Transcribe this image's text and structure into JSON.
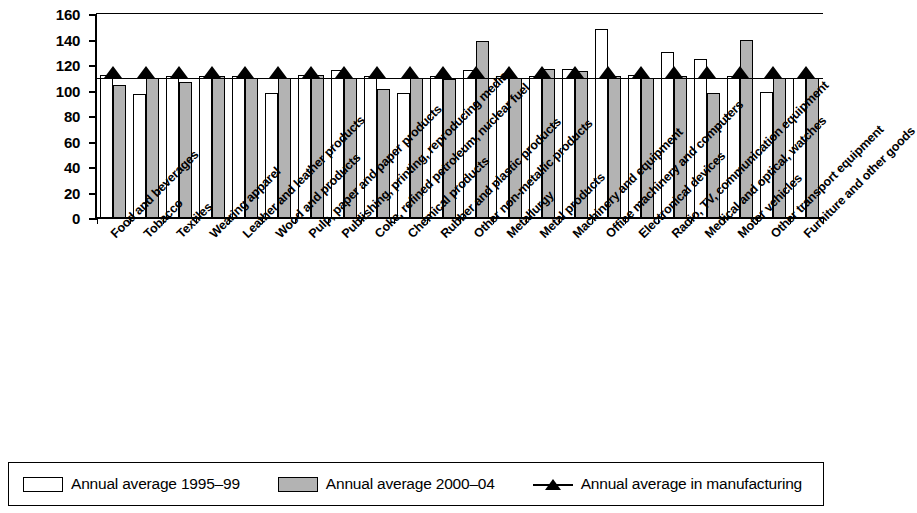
{
  "chart_data": {
    "type": "bar",
    "title": "",
    "xlabel": "",
    "ylabel": "",
    "ylim": [
      0,
      160
    ],
    "yticks": [
      0,
      20,
      40,
      60,
      80,
      100,
      120,
      140,
      160
    ],
    "grid": false,
    "legend_position": "bottom",
    "categories": [
      "Food and beverages",
      "Tobacco",
      "Textiles",
      "Wearing apparel",
      "Leather and leather products",
      "Wood and products",
      "Pulp, paper and paper products",
      "Publishing, printing, reproducing media",
      "Coke, refined petroleum, nuclear fuel",
      "Chemical products",
      "Rubber and plastic products",
      "Other non-metallic products",
      "Metallurgy",
      "Metal products",
      "Machinery and equipment",
      "Office machinery and computers",
      "Electronical devices",
      "Radio, TV, communication equipment",
      "Medical and optical, watches",
      "Motor vehicles",
      "Other transport equipment",
      "Furniture and other goods"
    ],
    "series": [
      {
        "name": "Annual average 1995-99",
        "color": "#ffffff",
        "values": [
          112,
          97,
          111,
          111,
          111,
          98,
          112,
          116,
          111,
          98,
          111,
          116,
          111,
          111,
          117,
          148,
          112,
          130,
          125,
          111,
          99,
          110
        ]
      },
      {
        "name": "Annual average 2000-04",
        "color": "#b3b3b3",
        "values": [
          104,
          110,
          107,
          111,
          110,
          110,
          112,
          110,
          101,
          110,
          109,
          139,
          110,
          117,
          115,
          111,
          110,
          111,
          98,
          140,
          110,
          110
        ]
      },
      {
        "name": "Annual average in manufacturing",
        "marker": "triangle",
        "color": "#000000",
        "constant_value": 110,
        "values": [
          110,
          110,
          110,
          110,
          110,
          110,
          110,
          110,
          110,
          110,
          110,
          110,
          110,
          110,
          110,
          110,
          110,
          110,
          110,
          110,
          110,
          110
        ]
      }
    ]
  },
  "legend": {
    "items": [
      {
        "label": "Annual average 1995–99",
        "swatch": "white-bar-swatch"
      },
      {
        "label": "Annual average 2000–04",
        "swatch": "gray-bar-swatch"
      },
      {
        "label": "Annual average in manufacturing",
        "swatch": "triangle-marker-swatch"
      }
    ]
  }
}
